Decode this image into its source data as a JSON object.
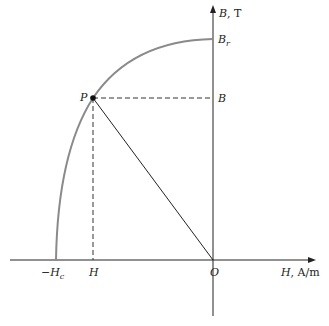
{
  "diagram": {
    "type": "demagnetization-curve",
    "colors": {
      "curve": "#8a8a8a",
      "axes": "#222222",
      "dashed": "#333333",
      "load_line": "#222222",
      "point": "#111111"
    },
    "axes": {
      "vertical_label_var": "B",
      "vertical_label_unit": ", T",
      "horizontal_label_var": "H",
      "horizontal_label_unit": ", A/m",
      "origin_label": "O"
    },
    "labels": {
      "remanence_var": "B",
      "remanence_sub": "r",
      "coercivity_prefix": "−",
      "coercivity_var": "H",
      "coercivity_sub": "c",
      "point_label": "P",
      "point_B": "B",
      "point_H": "H"
    }
  }
}
